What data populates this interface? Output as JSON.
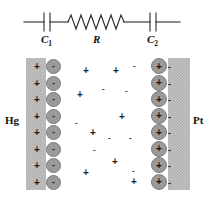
{
  "circuit": {
    "components": [
      {
        "id": "c1",
        "type": "capacitor",
        "label": "C",
        "subscript": "1"
      },
      {
        "id": "r",
        "type": "resistor",
        "label": "R",
        "subscript": ""
      },
      {
        "id": "c2",
        "type": "capacitor",
        "label": "C",
        "subscript": "2"
      }
    ],
    "wire_color": "#2a2a2a",
    "resistor_zigzags": 10
  },
  "cell": {
    "electrodes": [
      {
        "id": "hg",
        "label": "Hg",
        "side": "left",
        "surface_charge": "+",
        "counter_ion": "-"
      },
      {
        "id": "pt",
        "label": "Pt",
        "side": "right",
        "surface_charge": "+",
        "counter_ion": "-"
      }
    ],
    "electrode_color": "#c3c3c3",
    "ion_color": "#9a9a9a",
    "hg_surface_charges": [
      "+",
      "+",
      "+",
      "+",
      "+",
      "+",
      "+",
      "+"
    ],
    "hg_adsorbed_ions": [
      "-",
      "-",
      "-",
      "-",
      "-",
      "-",
      "-",
      "-"
    ],
    "pt_adsorbed_ions": [
      "+",
      "+",
      "+",
      "+",
      "+",
      "+",
      "+",
      "+"
    ],
    "pt_counter_ions": [
      "-",
      "-",
      "-",
      "-",
      "-",
      "-",
      "-",
      "-"
    ],
    "solution_ions": [
      {
        "sign": "+",
        "x": 83,
        "y": 12,
        "size": "p"
      },
      {
        "sign": "+",
        "x": 113,
        "y": 12,
        "size": "p"
      },
      {
        "sign": "-",
        "x": 133,
        "y": 8,
        "size": "sm"
      },
      {
        "sign": "+",
        "x": 77,
        "y": 36,
        "size": "p"
      },
      {
        "sign": "-",
        "x": 102,
        "y": 31,
        "size": "sm"
      },
      {
        "sign": "-",
        "x": 125,
        "y": 33,
        "size": "sm"
      },
      {
        "sign": "+",
        "x": 119,
        "y": 58,
        "size": "p"
      },
      {
        "sign": "-",
        "x": 75,
        "y": 65,
        "size": "sm"
      },
      {
        "sign": "+",
        "x": 90,
        "y": 74,
        "size": "p"
      },
      {
        "sign": "-",
        "x": 108,
        "y": 80,
        "size": "sm"
      },
      {
        "sign": "-",
        "x": 129,
        "y": 80,
        "size": "sm"
      },
      {
        "sign": "-",
        "x": 93,
        "y": 92,
        "size": "sm"
      },
      {
        "sign": "+",
        "x": 112,
        "y": 103,
        "size": "p"
      },
      {
        "sign": "+",
        "x": 83,
        "y": 114,
        "size": "p"
      },
      {
        "sign": "-",
        "x": 132,
        "y": 113,
        "size": "sm"
      },
      {
        "sign": "+",
        "x": 131,
        "y": 123,
        "size": "p"
      }
    ]
  }
}
